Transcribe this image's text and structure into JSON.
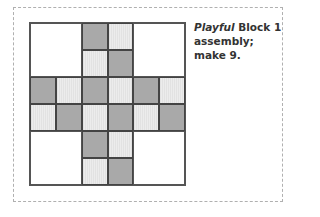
{
  "caption": {
    "italic": "Playful",
    "rest_line1": " Block 1",
    "line2": "assembly;",
    "line3": "make 9."
  },
  "quilt": {
    "rows": 6,
    "cols": 6,
    "colors": {
      "dark": "#a9a9a9",
      "light": "#e6e6e6",
      "background": "#ffffff"
    },
    "pattern": [
      [
        "W",
        "W",
        "D",
        "L",
        "W",
        "W"
      ],
      [
        "W",
        "W",
        "L",
        "D",
        "W",
        "W"
      ],
      [
        "D",
        "L",
        "D",
        "L",
        "D",
        "L"
      ],
      [
        "L",
        "D",
        "L",
        "D",
        "L",
        "D"
      ],
      [
        "W",
        "W",
        "D",
        "L",
        "W",
        "W"
      ],
      [
        "W",
        "W",
        "L",
        "D",
        "W",
        "W"
      ]
    ]
  }
}
